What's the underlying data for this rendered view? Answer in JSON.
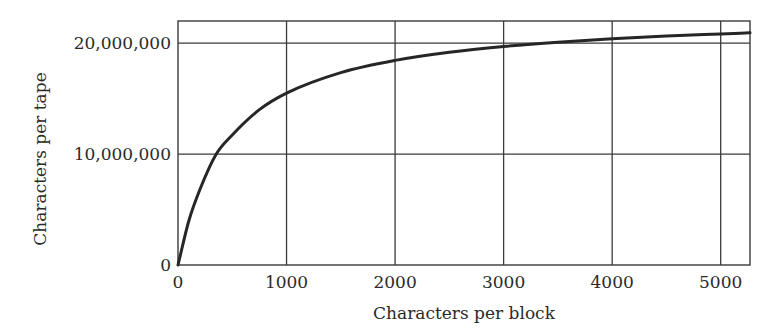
{
  "chart_data": {
    "type": "line",
    "title": "",
    "xlabel": "Characters per block",
    "ylabel": "Characters per tape",
    "xlim": [
      0,
      5270
    ],
    "ylim": [
      0,
      22000000
    ],
    "grid": true,
    "legend": null,
    "x_ticks": [
      0,
      1000,
      2000,
      3000,
      4000,
      5000
    ],
    "x_tick_labels": [
      "0",
      "1000",
      "2000",
      "3000",
      "4000",
      "5000"
    ],
    "y_ticks": [
      0,
      10000000,
      20000000
    ],
    "y_tick_labels": [
      "0",
      "10,000,000",
      "20,000,000"
    ],
    "series": [
      {
        "name": "Characters per tape",
        "color": "#262626",
        "x": [
          0,
          100,
          200,
          350,
          500,
          750,
          1000,
          1500,
          2000,
          2500,
          3000,
          3500,
          4000,
          4500,
          5000,
          5270
        ],
        "y": [
          0,
          3990000,
          6760000,
          9970000,
          11730000,
          14010000,
          15500000,
          17350000,
          18450000,
          19180000,
          19700000,
          20090000,
          20390000,
          20640000,
          20830000,
          20930000
        ]
      }
    ]
  },
  "plot": {
    "left": 178,
    "right": 750,
    "top": 21,
    "bottom": 265,
    "x_px_per_unit": 0.1086,
    "y_px_per_unit": 1.06e-05
  }
}
